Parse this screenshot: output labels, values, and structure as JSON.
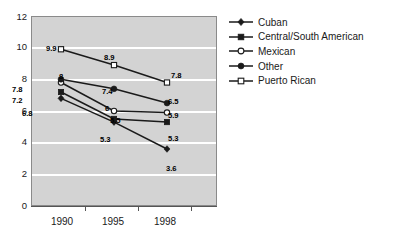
{
  "chart_data": {
    "type": "line",
    "title": "",
    "subtitle": "",
    "xlabel": "",
    "ylabel": "",
    "x": [
      "1990",
      "1995",
      "1998"
    ],
    "categories": [
      "1990",
      "1995",
      "1998"
    ],
    "ylim": [
      0,
      12
    ],
    "yticks": [
      0,
      2,
      4,
      6,
      8,
      10,
      12
    ],
    "ytick_labels": [
      "0",
      "2",
      "4",
      "6",
      "8",
      "10",
      "12"
    ],
    "grid": "horizontal",
    "legend_position": "right",
    "plot_background": "#d3d3d3",
    "gridline_color": "#ffffff",
    "line_color": "#1a1a1a",
    "series": [
      {
        "name": "Cuban",
        "marker": "filled-diamond",
        "values": [
          6.8,
          5.3,
          3.6
        ],
        "labels": [
          "6.8",
          "5.3",
          "3.6"
        ]
      },
      {
        "name": "Central/South American",
        "marker": "filled-square",
        "values": [
          7.2,
          5.5,
          5.3
        ],
        "labels": [
          "7.2",
          "5.5",
          "5.3"
        ]
      },
      {
        "name": "Mexican",
        "marker": "open-circle",
        "values": [
          7.8,
          6.0,
          5.9
        ],
        "labels": [
          "7.8",
          "6",
          "5.9"
        ]
      },
      {
        "name": "Other",
        "marker": "filled-circle",
        "values": [
          8.0,
          7.4,
          6.5
        ],
        "labels": [
          "8",
          "7.4",
          "6.5"
        ]
      },
      {
        "name": "Puerto Rican",
        "marker": "open-square",
        "values": [
          9.9,
          8.9,
          7.8
        ],
        "labels": [
          "9.9",
          "8.9",
          "7.8"
        ]
      }
    ]
  },
  "axis": {
    "y_labels": [
      "12",
      "10",
      "8",
      "6",
      "4",
      "2",
      "0"
    ],
    "x_labels": [
      "1990",
      "1995",
      "1998"
    ]
  },
  "legend": {
    "items": [
      {
        "label": "Cuban",
        "marker": "filled-diamond"
      },
      {
        "label": "Central/South American",
        "marker": "filled-square"
      },
      {
        "label": "Mexican",
        "marker": "open-circle"
      },
      {
        "label": "Other",
        "marker": "filled-circle"
      },
      {
        "label": "Puerto Rican",
        "marker": "open-square"
      }
    ]
  },
  "point_labels": [
    {
      "text": "9.9",
      "x": 46,
      "y": 45
    },
    {
      "text": "8.9",
      "x": 104,
      "y": 54
    },
    {
      "text": "7.8",
      "x": 171,
      "y": 72
    },
    {
      "text": "8",
      "x": 59,
      "y": 73
    },
    {
      "text": "7.4",
      "x": 102,
      "y": 88
    },
    {
      "text": "6.5",
      "x": 168,
      "y": 98
    },
    {
      "text": "7.8",
      "x": 12,
      "y": 86
    },
    {
      "text": "6",
      "x": 105,
      "y": 105
    },
    {
      "text": "5.9",
      "x": 168,
      "y": 112
    },
    {
      "text": "7.2",
      "x": 12,
      "y": 97
    },
    {
      "text": "5.5",
      "x": 110,
      "y": 117
    },
    {
      "text": "5.3",
      "x": 168,
      "y": 135
    },
    {
      "text": "6.8",
      "x": 22,
      "y": 110
    },
    {
      "text": "5.3",
      "x": 100,
      "y": 136
    },
    {
      "text": "3.6",
      "x": 166,
      "y": 165
    }
  ]
}
